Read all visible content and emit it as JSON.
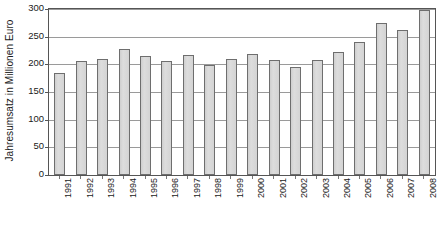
{
  "chart_data": {
    "type": "bar",
    "title": "",
    "xlabel": "",
    "ylabel": "Jahresumsatz in Millionen Euro",
    "ylim": [
      0,
      300
    ],
    "ytick_labels": [
      "0",
      "50",
      "100",
      "150",
      "200",
      "250",
      "300"
    ],
    "yticks": [
      0,
      50,
      100,
      150,
      200,
      250,
      300
    ],
    "grid": true,
    "legend": "none",
    "categories": [
      "1991",
      "1992",
      "1993",
      "1994",
      "1995",
      "1996",
      "1997",
      "1998",
      "1999",
      "2000",
      "2001",
      "2002",
      "2003",
      "2004",
      "2005",
      "2006",
      "2007",
      "2008"
    ],
    "values": [
      185,
      206,
      210,
      227,
      215,
      206,
      216,
      198,
      210,
      219,
      208,
      196,
      208,
      222,
      241,
      275,
      262,
      299
    ]
  },
  "colors": {
    "bar_fill": "#d6d6d6",
    "bar_border": "#6e6e6e",
    "gridline": "#9a9a9a",
    "axis": "#555555",
    "text": "#1a1a1a",
    "background": "#ffffff"
  }
}
